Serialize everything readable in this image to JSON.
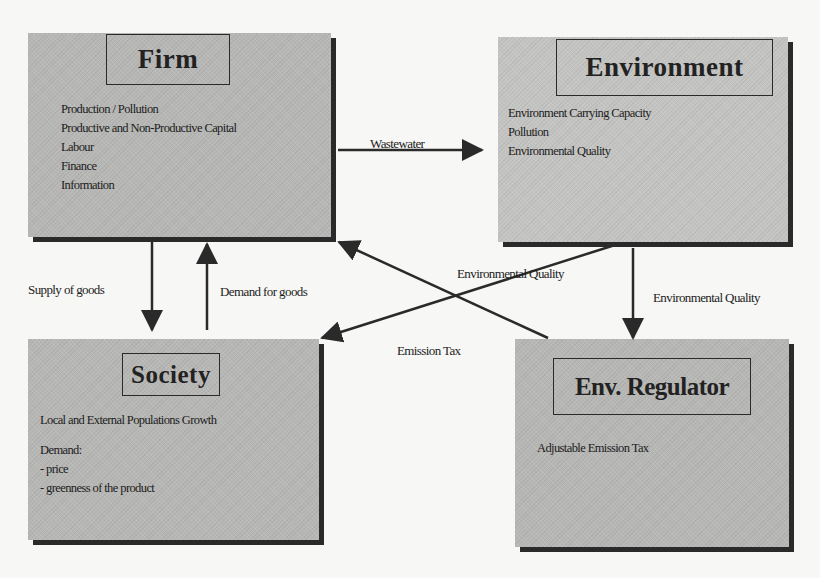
{
  "boxes": {
    "firm": {
      "title": "Firm",
      "items": [
        "Production / Pollution",
        "Productive and Non-Productive Capital",
        "Labour",
        "Finance",
        "Information"
      ]
    },
    "environment": {
      "title": "Environment",
      "items": [
        "Environment Carrying Capacity",
        "Pollution",
        "Environmental Quality"
      ]
    },
    "society": {
      "title": "Society",
      "items": [
        "Local and External Populations Growth",
        "",
        "Demand:",
        "- price",
        "- greenness of the product"
      ]
    },
    "regulator": {
      "title": "Env. Regulator",
      "items": [
        "Adjustable Emission Tax"
      ]
    }
  },
  "flows": {
    "firm_to_environment": "Wastewater",
    "firm_to_society": "Supply of goods",
    "society_to_firm": "Demand for goods",
    "environment_to_society": "Environmental Quality",
    "environment_to_regulator": "Environmental Quality",
    "regulator_to_firm": "Emission Tax"
  },
  "colors": {
    "box_fill": "#b7b7b5",
    "shadow": "#2a2a2a",
    "arrow": "#2a2a2a",
    "background": "#f7f7f5"
  }
}
